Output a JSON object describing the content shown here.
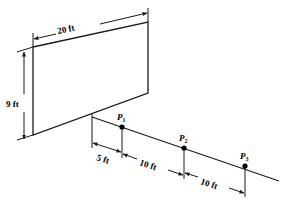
{
  "figure": {
    "title": "",
    "stroke_color": "#1a1a1a",
    "fill_color": "#ffffff",
    "background": "#ffffff"
  },
  "shape": {
    "name": "parallelogram-wall",
    "width_label": "20 ft",
    "height_label": "9 ft"
  },
  "dimensions": {
    "top": "20 ft",
    "left": "9 ft",
    "seg1": "5 ft",
    "seg2": "10 ft",
    "seg3": "10 ft"
  },
  "points": [
    {
      "name": "P1",
      "base": "P",
      "sub": "1"
    },
    {
      "name": "P2",
      "base": "P",
      "sub": "2"
    },
    {
      "name": "P3",
      "base": "P",
      "sub": "3"
    }
  ]
}
